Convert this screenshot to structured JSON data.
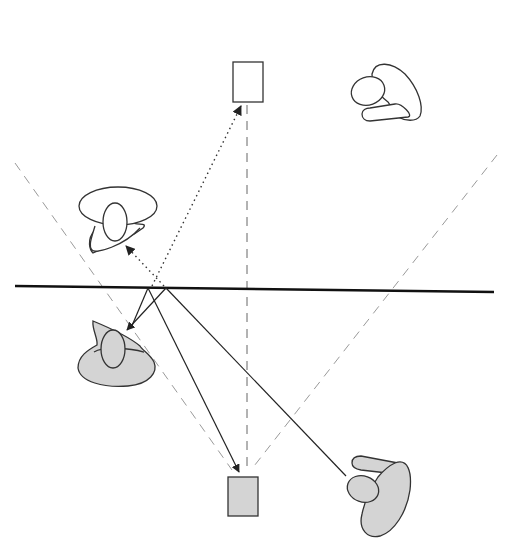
{
  "diagram": {
    "title": "Mirror reflection diagram: observers and objects with their virtual images",
    "colors": {
      "background": "#ffffff",
      "stroke": "#333333",
      "guide": "#9a9a9a",
      "real_fill": "#d4d4d4",
      "virtual_fill": "#ffffff"
    },
    "mirror": {
      "x1": 15,
      "y1": 286,
      "x2": 494,
      "y2": 292
    },
    "guides": {
      "vertical": {
        "x1": 247,
        "y1": 105,
        "x2": 247,
        "y2": 470
      },
      "left_diagonal": {
        "x1": 15,
        "y1": 163,
        "x2": 232,
        "y2": 470
      },
      "right_diagonal": {
        "x1": 497,
        "y1": 155,
        "x2": 251,
        "y2": 470
      }
    },
    "objects": [
      {
        "id": "real-box",
        "type": "rectangle",
        "fill": "real",
        "x": 228,
        "y": 477,
        "w": 30,
        "h": 39
      },
      {
        "id": "virtual-box",
        "type": "rectangle",
        "fill": "virtual",
        "x": 233,
        "y": 62,
        "w": 30,
        "h": 40
      },
      {
        "id": "real-head-left",
        "type": "head",
        "fill": "real"
      },
      {
        "id": "virtual-head-left",
        "type": "head",
        "fill": "virtual"
      },
      {
        "id": "real-head-right",
        "type": "head",
        "fill": "real"
      },
      {
        "id": "virtual-head-right",
        "type": "head",
        "fill": "virtual"
      }
    ],
    "rays": [
      {
        "style": "solid",
        "from": [
          148,
          288
        ],
        "to": [
          239,
          472
        ],
        "arrow": true
      },
      {
        "style": "solid",
        "from": [
          166,
          288
        ],
        "to": [
          346,
          476
        ],
        "arrow": false
      },
      {
        "style": "solid",
        "from": [
          166,
          288
        ],
        "to": [
          127,
          330
        ],
        "arrow": true
      },
      {
        "style": "solid",
        "from": [
          148,
          288
        ],
        "to": [
          131,
          328
        ],
        "arrow": false
      },
      {
        "style": "dotted",
        "from": [
          152,
          286
        ],
        "to": [
          241,
          106
        ],
        "arrow": true
      },
      {
        "style": "dotted",
        "from": [
          164,
          286
        ],
        "to": [
          126,
          246
        ],
        "arrow": true
      }
    ]
  }
}
